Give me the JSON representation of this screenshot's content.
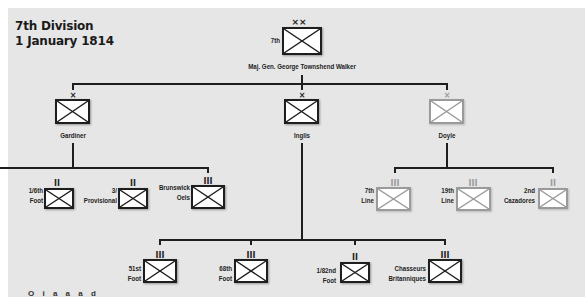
{
  "title": {
    "line1": "7th Division",
    "line2": "1 January 1814"
  },
  "division": {
    "name": "7th",
    "size_symbol": "××",
    "commander": "Maj. Gen. George Townshend Walker"
  },
  "brigades": [
    {
      "commander": "Gardiner",
      "size_symbol": "×",
      "style": "black",
      "units": [
        {
          "label_line1": "1/6th",
          "label_line2": "Foot",
          "size_symbol": "II"
        },
        {
          "label_line1": "3/",
          "label_line2": "Provisional",
          "size_symbol": "II"
        },
        {
          "label_line1": "Brunswick",
          "label_line2": "Oels",
          "size_symbol": "III"
        }
      ]
    },
    {
      "commander": "Inglis",
      "size_symbol": "×",
      "style": "black",
      "units": [
        {
          "label_line1": "51st",
          "label_line2": "Foot",
          "size_symbol": "III"
        },
        {
          "label_line1": "68th",
          "label_line2": "Foot",
          "size_symbol": "III"
        },
        {
          "label_line1": "1/82nd",
          "label_line2": "Foot",
          "size_symbol": "II"
        },
        {
          "label_line1": "Chasseurs",
          "label_line2": "Britanniques",
          "size_symbol": "III"
        }
      ]
    },
    {
      "commander": "Doyle",
      "size_symbol": "×",
      "style": "grey",
      "units": [
        {
          "label_line1": "7th",
          "label_line2": "Line",
          "size_symbol": "III"
        },
        {
          "label_line1": "19th",
          "label_line2": "Line",
          "size_symbol": "III"
        },
        {
          "label_line1": "2nd",
          "label_line2": "Cazadores",
          "size_symbol": "II"
        }
      ]
    }
  ],
  "colors": {
    "background": "#e6e6e6",
    "british": "#1e1e1e",
    "portuguese": "#9a9a9a"
  },
  "footer": {
    "partial_text": "O i  a  a  a  d"
  }
}
